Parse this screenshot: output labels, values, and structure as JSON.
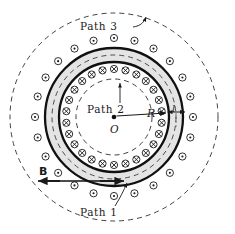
{
  "figure": {
    "center_marker": "O",
    "labels": {
      "path1": "Path 1",
      "path2": "Path 2",
      "path3": "Path 3",
      "radius": "R",
      "thickness": "l",
      "field": "B"
    },
    "colors": {
      "stroke": "#1a1a1a",
      "torus_fill": "#e4e4e4",
      "dash_stroke": "#2b2b2b",
      "background": "#ffffff",
      "symbol_fill": "#ffffff"
    },
    "geometry": {
      "center_x": 114,
      "center_y": 117,
      "torus_inner_radius": 55,
      "torus_outer_radius": 69,
      "torus_mid_dashed_radius": 62,
      "path2_radius": 38,
      "path3_radius": 104,
      "inner_symbol_ring_radius": 48,
      "outer_symbol_ring_radius": 79,
      "inner_symbol_count": 26,
      "outer_symbol_count": 24,
      "symbol_radius": 3.6
    },
    "symbols": {
      "inner_ring": "cross-in-circle",
      "inner_ring_meaning": "current into page",
      "outer_ring": "dot-in-circle",
      "outer_ring_meaning": "current out of page"
    },
    "annotations": {
      "radius_arrow": "arrow from center O to torus inner wall",
      "thickness_arrow": "double-headed arrow across torus wall thickness",
      "field_arrow": "double-headed horizontal arrow labelled B",
      "path1_leader": "leader line from Path 1 label to mid dashed circle",
      "path2_leader": "arrow from Path 2 label to inner dashed circle",
      "path3_leader": "leader line from Path 3 label to outer dashed circle"
    }
  },
  "chart_data": {
    "type": "diagram",
    "elements": [
      {
        "name": "Path 1",
        "kind": "dashed circle",
        "radius": 62,
        "note": "inside toroid winding region"
      },
      {
        "name": "Path 2",
        "kind": "dashed circle",
        "radius": 38,
        "note": "inside hole of toroid"
      },
      {
        "name": "Path 3",
        "kind": "dashed circle",
        "radius": 104,
        "note": "outside toroid"
      },
      {
        "name": "R",
        "kind": "radius arrow",
        "value": 55,
        "note": "center to inner wall"
      },
      {
        "name": "l",
        "kind": "thickness dimension",
        "value": 14,
        "note": "toroid wall thickness"
      },
      {
        "name": "B",
        "kind": "field arrow",
        "note": "magnetic field direction, double arrow"
      }
    ]
  }
}
